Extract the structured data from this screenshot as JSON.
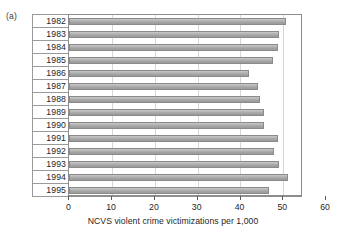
{
  "figure": {
    "panel_label": "(a)"
  },
  "chart_data": {
    "type": "bar",
    "orientation": "horizontal",
    "title": "",
    "subtitle": "",
    "xlabel": "NCVS violent crime victimizations per 1,000",
    "ylabel": "",
    "categories": [
      "1982",
      "1983",
      "1984",
      "1985",
      "1986",
      "1987",
      "1988",
      "1989",
      "1990",
      "1991",
      "1992",
      "1993",
      "1994",
      "1995"
    ],
    "values": [
      50.7,
      49.0,
      48.8,
      47.5,
      42.0,
      44.0,
      44.6,
      45.6,
      45.5,
      48.8,
      47.9,
      49.1,
      51.2,
      46.6
    ],
    "xlim": [
      0,
      60
    ],
    "xticks": [
      0,
      10,
      20,
      30,
      40,
      50,
      60
    ],
    "xtick_labels": [
      "0",
      "10",
      "20",
      "30",
      "40",
      "50",
      "60"
    ],
    "grid": "vertical",
    "legend": null,
    "bar_color": "#b0b0b0",
    "bar_edge_color": "#8a8a8a",
    "gridline_color": "#d6d6d6",
    "axis_color": "#8d8d8d"
  }
}
